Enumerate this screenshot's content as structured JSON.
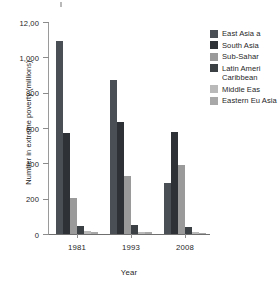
{
  "chart_data": {
    "type": "bar",
    "title": "",
    "xlabel": "Year",
    "ylabel": "Number in extreme poverty (millions)",
    "categories": [
      "1981",
      "1993",
      "2008"
    ],
    "ylim": [
      0,
      1200
    ],
    "ytick_labels": [
      "0",
      "200",
      "400",
      "600",
      "800",
      "1,000",
      "12,00"
    ],
    "ytick_values": [
      0,
      200,
      400,
      600,
      800,
      1000,
      1200
    ],
    "grid": false,
    "legend_position": "right",
    "series": [
      {
        "name": "East Asia a",
        "color": "#4a4f55",
        "values": [
          1095,
          870,
          290
        ]
      },
      {
        "name": "South Asia",
        "color": "#2e3236",
        "values": [
          570,
          635,
          575
        ]
      },
      {
        "name": "Sub-Sahar",
        "color": "#9a9a9a",
        "values": [
          205,
          330,
          390
        ]
      },
      {
        "name": "Latin Ameri",
        "name_line2": "Caribbean",
        "color": "#3b4045",
        "values": [
          45,
          52,
          38
        ]
      },
      {
        "name": "Middle Eas",
        "color": "#b9b9b9",
        "values": [
          18,
          12,
          10
        ]
      },
      {
        "name": "Eastern Eu",
        "name_line2": "Asia",
        "color": "#a8a8a8",
        "values": [
          10,
          14,
          6
        ]
      }
    ]
  },
  "legend": {
    "items": [
      {
        "label": "East Asia a",
        "label2": "",
        "color": "#4a4f55"
      },
      {
        "label": "South Asia",
        "label2": "",
        "color": "#2e3236"
      },
      {
        "label": "Sub-Sahar",
        "label2": "",
        "color": "#9a9a9a"
      },
      {
        "label": "Latin Ameri",
        "label2": "Caribbean",
        "color": "#3b4045"
      },
      {
        "label": "Middle Eas",
        "label2": "",
        "color": "#b9b9b9"
      },
      {
        "label": "Eastern Eu",
        "label2": "Asia",
        "color": "#a8a8a8"
      }
    ]
  },
  "axes": {
    "y_title": "Number in extreme poverty (millions)",
    "x_title": "Year"
  }
}
